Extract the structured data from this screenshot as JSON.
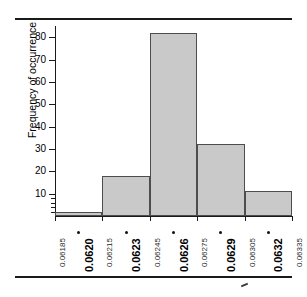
{
  "chart_data": {
    "type": "bar",
    "title": "",
    "xlabel": "",
    "ylabel": "Frequency of occurrence",
    "ylim": [
      0,
      85
    ],
    "grid": false,
    "legend": null,
    "bin_edges": [
      "0.06185",
      "0.06215",
      "0.06245",
      "0.06275",
      "0.06305",
      "0.06335"
    ],
    "categories": [
      "0.0620",
      "0.0623",
      "0.0626",
      "0.0629",
      "0.0632"
    ],
    "values": [
      2,
      18,
      82,
      32,
      11
    ],
    "y_ticks": [
      10,
      20,
      30,
      40,
      50,
      60,
      70,
      80
    ],
    "y_tick_labels": [
      "10",
      "20",
      "30",
      "40",
      "50",
      "60",
      "70",
      "80"
    ],
    "bar_fill_color": "#c9c9c9",
    "bar_edge_color": "#4d4d4d",
    "axis_color": "#1a1a1a"
  },
  "axes": {
    "y_title": "Frequency of occurrence",
    "y_labels": [
      "80",
      "70",
      "60",
      "50",
      "40",
      "30",
      "20",
      "10"
    ]
  },
  "x_axis": {
    "edge_labels": [
      "0.06185",
      "0.06215",
      "0.06245",
      "0.06275",
      "0.06305",
      "0.06335"
    ],
    "center_labels": [
      "0.0620",
      "0.0623",
      "0.0626",
      "0.0629",
      "0.0632"
    ]
  },
  "bars": [
    {
      "label": "0.0620",
      "value": 2
    },
    {
      "label": "0.0623",
      "value": 18
    },
    {
      "label": "0.0626",
      "value": 82
    },
    {
      "label": "0.0629",
      "value": 32
    },
    {
      "label": "0.0632",
      "value": 11
    }
  ]
}
